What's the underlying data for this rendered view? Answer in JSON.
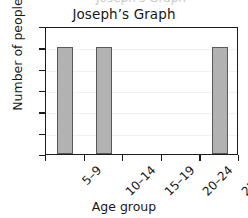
{
  "figure": {
    "clipped_header_text": "Joseph's Graph",
    "background_color": "#ffffff"
  },
  "chart_data": {
    "type": "bar",
    "title": "Joseph’s Graph",
    "xlabel": "Age group",
    "ylabel": "Number of people",
    "categories": [
      "5–9",
      "10–14",
      "15–19",
      "20–24",
      "25–29"
    ],
    "values": [
      10,
      10,
      0,
      0,
      10
    ],
    "ylim": [
      0,
      12
    ],
    "ytick_labels": [
      "12",
      "10",
      "8",
      "6",
      "4",
      "2",
      "0"
    ],
    "ytick_values": [
      12,
      10,
      8,
      6,
      4,
      2,
      0
    ],
    "ytick_step": 2,
    "grid": "horizontal",
    "legend": "none",
    "bar_color": "#b2b2b2",
    "bar_edge_color": "#595959",
    "axis_color": "#1b1b1b",
    "gridline_color": "#f1f1f1",
    "xtick_label_rotation": -45
  }
}
